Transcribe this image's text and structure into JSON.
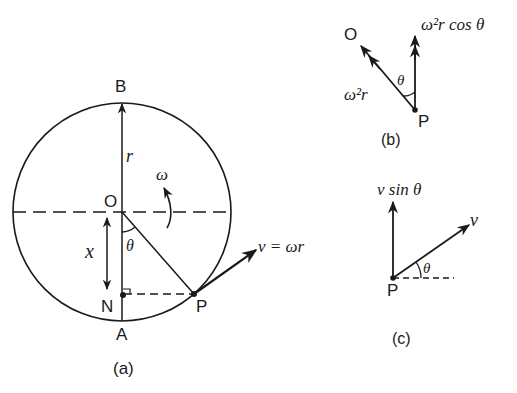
{
  "figure": {
    "panel_a": {
      "caption": "(a)",
      "points": {
        "B": "B",
        "O": "O",
        "N": "N",
        "A": "A",
        "P": "P"
      },
      "labels": {
        "radius": "r",
        "omega": "ω",
        "theta": "θ",
        "x": "x",
        "velocity": "v = ωr"
      }
    },
    "panel_b": {
      "caption": "(b)",
      "points": {
        "O": "O",
        "P": "P"
      },
      "labels": {
        "centripetal": "ω²r",
        "component": "ω²r cos θ",
        "theta": "θ"
      }
    },
    "panel_c": {
      "caption": "(c)",
      "points": {
        "P": "P"
      },
      "labels": {
        "component": "v sin θ",
        "velocity": "v",
        "theta": "θ"
      }
    },
    "colors": {
      "ink": "#1a1a1a",
      "background": "#ffffff"
    }
  }
}
